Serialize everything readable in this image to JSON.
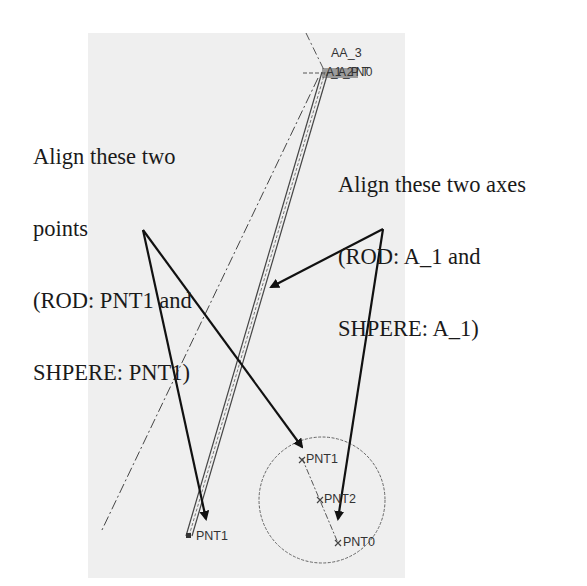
{
  "callouts": {
    "points": {
      "lines": [
        "Align these two",
        "points",
        "(ROD: PNT1 and",
        "SHPERE: PNT1)"
      ]
    },
    "axes": {
      "lines": [
        "Align these two axes",
        "(ROD: A_1 and",
        "SHPERE: A_1)"
      ]
    }
  },
  "cad_labels": {
    "top_axis": "AA_3",
    "top_cluster": "A_1 A_2 PNT0",
    "rod_pnt1": "PNT1",
    "sphere_pnt1": "PNT1",
    "sphere_pnt2": "PNT2",
    "sphere_pnt0": "PNT0"
  },
  "colors": {
    "panel": "#efefef",
    "ink": "#1a1a1a",
    "cad_line": "#555555"
  }
}
